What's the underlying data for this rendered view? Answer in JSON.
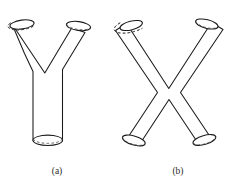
{
  "figure": {
    "background_color": "#ffffff",
    "stroke_color": "#1a1a1a",
    "hidden_edge_color": "#4a4a4a",
    "fill_color": "#ffffff",
    "width": 238,
    "height": 185,
    "panels": [
      {
        "id": "panel-a",
        "caption": "(a)",
        "caption_x": 57,
        "caption_y": 172,
        "shape_name": "y-junction-tube",
        "shape_label": "Y",
        "openings": 3,
        "opening_names": [
          "top-left-opening",
          "top-right-opening",
          "bottom-stem-opening"
        ]
      },
      {
        "id": "panel-b",
        "caption": "(b)",
        "caption_x": 178,
        "caption_y": 172,
        "shape_name": "x-junction-tube",
        "shape_label": "X",
        "openings": 4,
        "opening_names": [
          "top-left-opening",
          "top-right-opening",
          "bottom-left-opening",
          "bottom-right-opening"
        ]
      }
    ]
  },
  "geometry": {
    "panel_a": {
      "body_path": "M 11.5 26.5 L 44.5 74.5 L 72.5 29.5 L 84.0 33.5 L 62.5 70.0 L 62.5 140.5 L 33.0 140.5 L 33.0 72.0 L 11.5 26.5 Z",
      "caps": [
        {
          "name": "top-left-opening",
          "cx": 22.0,
          "cy": 23.5,
          "rx": 12.2,
          "ry": 4.4,
          "rot": -8
        },
        {
          "name": "top-right-opening",
          "cx": 78.5,
          "cy": 26.0,
          "rx": 12.2,
          "ry": 4.4,
          "rot": 8
        },
        {
          "name": "bottom-stem-opening",
          "cx": 47.8,
          "cy": 140.5,
          "rx": 14.8,
          "ry": 5.2,
          "rot": 0
        }
      ]
    },
    "panel_b": {
      "body_paths": [
        "M 126.0 25.0 L 184.5 114.5 L 196.5 135.5 L 206.5 130.0 L 137.5 21.0 Z",
        "M 212.0 24.0 L 153.5 114.5 L 141.5 135.5 L 131.5 130.0 L 200.5 20.0 Z"
      ],
      "merged_path": "M 126.2 25.2 L 168.8 90.0 L 211.8 24.2 L 222.0 30.2 L 180.5 92.5 L 210.5 137.0 L 199.5 143.0 L 169.0 98.5 L 139.0 143.0 L 127.8 137.0 L 157.5 92.5 L 116.0 30.8 Z",
      "caps": [
        {
          "name": "top-left-opening",
          "cx": 131.0,
          "cy": 25.5,
          "rx": 11.5,
          "ry": 4.3,
          "rot": -14
        },
        {
          "name": "top-right-opening",
          "cx": 207.0,
          "cy": 24.0,
          "rx": 11.5,
          "ry": 4.3,
          "rot": 14
        },
        {
          "name": "bottom-left-opening",
          "cx": 133.5,
          "cy": 140.5,
          "rx": 11.8,
          "ry": 4.5,
          "rot": 16
        },
        {
          "name": "bottom-right-opening",
          "cx": 204.5,
          "cy": 140.0,
          "rx": 11.8,
          "ry": 4.5,
          "rot": -16
        }
      ]
    }
  }
}
